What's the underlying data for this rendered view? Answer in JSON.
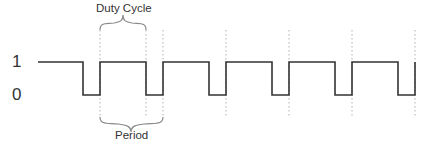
{
  "diagram": {
    "y_levels": {
      "high_label": "1",
      "low_label": "0"
    },
    "annotations": {
      "duty_cycle": "Duty Cycle",
      "period": "Period"
    },
    "colors": {
      "waveform": "#333333",
      "dotted_guides": "#b0b0b0",
      "brace": "#8a8a8a",
      "text": "#333333"
    },
    "waveform": {
      "high_y": 62,
      "low_y": 95,
      "start_x": 38,
      "falling_edges_x": [
        83,
        146,
        209,
        272,
        335,
        398
      ],
      "rising_edges_x": [
        100,
        163,
        226,
        289,
        352,
        415
      ]
    },
    "guides_x": [
      100,
      146,
      163,
      226,
      289,
      352,
      415
    ]
  }
}
